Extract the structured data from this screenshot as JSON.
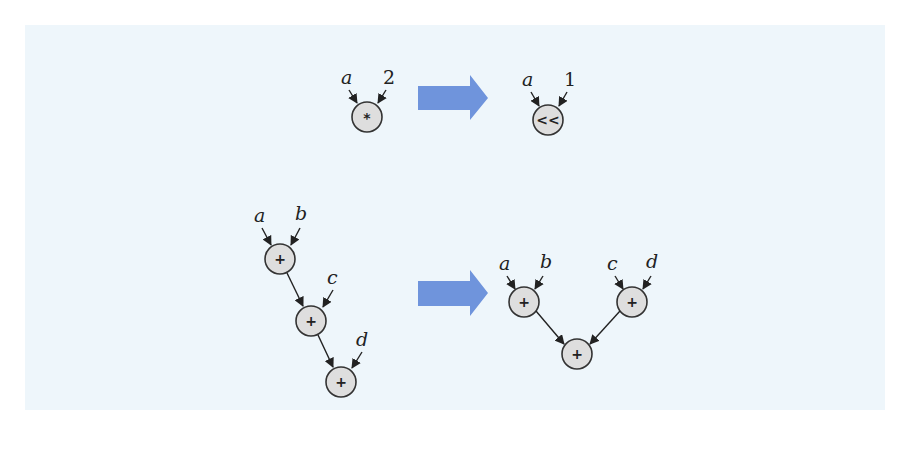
{
  "figure": {
    "background_color": "#eef6fb",
    "arrow_color": "#6f94dc",
    "node_fill": "#dedede",
    "rows": [
      {
        "name": "strength-reduction",
        "before": {
          "inputs": [
            "a",
            "2"
          ],
          "operator": "*"
        },
        "after": {
          "inputs": [
            "a",
            "1"
          ],
          "operator": "<<"
        }
      },
      {
        "name": "tree-height-reduction",
        "before": {
          "labels": [
            "a",
            "b",
            "c",
            "d"
          ],
          "operators": [
            "+",
            "+",
            "+"
          ]
        },
        "after": {
          "labels": [
            "a",
            "b",
            "c",
            "d"
          ],
          "operators": [
            "+",
            "+",
            "+"
          ]
        }
      }
    ]
  }
}
